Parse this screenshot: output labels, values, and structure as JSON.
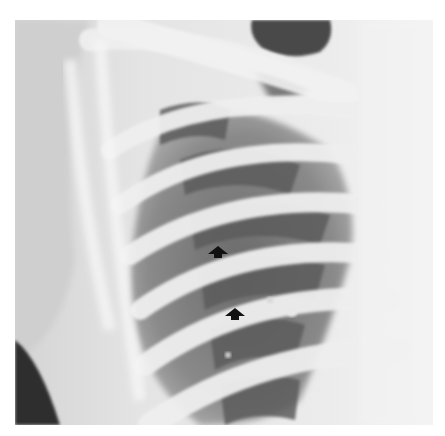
{
  "image": {
    "type": "radiograph",
    "subject": "chest x-ray, lateral ribs and lung field",
    "background_color": "#ffffff",
    "film_colors": {
      "bone_light": "#f2f2f2",
      "soft_tissue": "#d9d9d9",
      "lung_dark": "#5a5a5a",
      "lung_mid": "#8a8a8a",
      "arrow": "#111111"
    }
  },
  "annotations": {
    "arrows": [
      {
        "label": "arrow-upper",
        "x": 218,
        "y": 252,
        "direction": "up-left"
      },
      {
        "label": "arrow-lower",
        "x": 235,
        "y": 314,
        "direction": "up-left"
      }
    ]
  }
}
